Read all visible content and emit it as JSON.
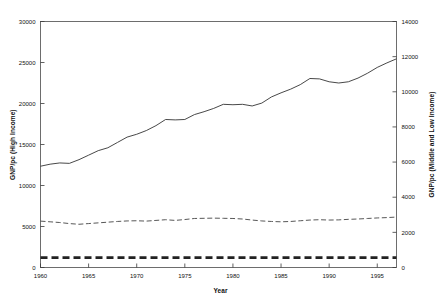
{
  "chart_data": {
    "type": "line",
    "title": "",
    "xlabel": "Year",
    "ylabel": "GNP/pc (High Income)",
    "ylabel_right": "GNP/pc (Middle and Low Income)",
    "xlim": [
      1960,
      1997
    ],
    "ylim": [
      0,
      30000
    ],
    "ylim_right": [
      0,
      14000
    ],
    "xticks": [
      1960,
      1965,
      1970,
      1975,
      1980,
      1985,
      1990,
      1995
    ],
    "xticklabels": [
      "1960",
      "1965",
      "1970",
      "1975",
      "1980",
      "1985",
      "1990",
      "1995"
    ],
    "yticks": [
      0,
      5000,
      10000,
      15000,
      20000,
      25000,
      30000
    ],
    "yticklabels": [
      "0",
      "5000",
      "10000",
      "15000",
      "20000",
      "25000",
      "30000"
    ],
    "yticks_right": [
      0,
      2000,
      4000,
      6000,
      8000,
      10000,
      12000,
      14000
    ],
    "yticklabels_right": [
      "0",
      "2000",
      "4000",
      "6000",
      "8000",
      "10000",
      "12000",
      "14000"
    ],
    "grid": false,
    "legend": "none",
    "x": [
      1960,
      1961,
      1962,
      1963,
      1964,
      1965,
      1966,
      1967,
      1968,
      1969,
      1970,
      1971,
      1972,
      1973,
      1974,
      1975,
      1976,
      1977,
      1978,
      1979,
      1980,
      1981,
      1982,
      1983,
      1984,
      1985,
      1986,
      1987,
      1988,
      1989,
      1990,
      1991,
      1992,
      1993,
      1994,
      1995,
      1996,
      1997
    ],
    "series": [
      {
        "name": "High Income",
        "axis": "left",
        "style": "solid",
        "color": "#333333",
        "values": [
          12350,
          12600,
          12750,
          12700,
          13150,
          13700,
          14250,
          14600,
          15250,
          15900,
          16250,
          16700,
          17300,
          18050,
          18000,
          18050,
          18650,
          19000,
          19400,
          19900,
          19850,
          19900,
          19700,
          20050,
          20800,
          21300,
          21750,
          22300,
          23050,
          23000,
          22650,
          22500,
          22650,
          23100,
          23700,
          24400,
          24950,
          25450
        ]
      },
      {
        "name": "Middle and Low Income",
        "axis": "right",
        "style": "dashed",
        "color": "#444444",
        "values": [
          2640,
          2600,
          2560,
          2500,
          2460,
          2500,
          2540,
          2580,
          2620,
          2650,
          2660,
          2640,
          2680,
          2720,
          2680,
          2730,
          2790,
          2800,
          2810,
          2800,
          2790,
          2760,
          2700,
          2650,
          2620,
          2600,
          2620,
          2660,
          2700,
          2720,
          2700,
          2710,
          2740,
          2760,
          2790,
          2820,
          2840,
          2870
        ]
      },
      {
        "name": "Low Income",
        "axis": "right",
        "style": "heavy-dashed",
        "color": "#222222",
        "values": [
          560,
          560,
          560,
          560,
          560,
          560,
          560,
          560,
          560,
          560,
          560,
          560,
          560,
          560,
          560,
          560,
          560,
          560,
          560,
          560,
          560,
          560,
          560,
          560,
          560,
          560,
          560,
          560,
          560,
          560,
          560,
          560,
          560,
          560,
          560,
          560,
          560,
          560
        ]
      }
    ]
  },
  "axes": {
    "left_title": "GNP/pc (High Income)",
    "right_title": "GNP/pc (Middle and Low Income)",
    "x_title": "Year"
  }
}
